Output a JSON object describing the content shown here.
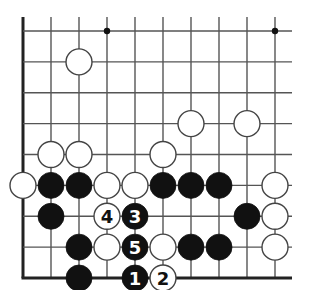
{
  "diagram": {
    "type": "go-board-fragment",
    "columns": 10,
    "rows": 9,
    "edges": {
      "left": true,
      "bottom": true,
      "top": false,
      "right": false
    },
    "grid": {
      "x0": 23,
      "dx": 28.0,
      "y0": 31,
      "dy": 30.9,
      "top_extend": 14,
      "right_extend": 17
    },
    "colors": {
      "line": "#555555",
      "edge": "#222222",
      "black": "#111111",
      "white": "#ffffff",
      "stone_outline": "#444444"
    },
    "star_points": [
      {
        "col": 4,
        "row": 1
      },
      {
        "col": 10,
        "row": 1
      }
    ],
    "stones": [
      {
        "color": "white",
        "col": 3,
        "row": 2
      },
      {
        "color": "white",
        "col": 7,
        "row": 4
      },
      {
        "color": "white",
        "col": 9,
        "row": 4
      },
      {
        "color": "white",
        "col": 2,
        "row": 5
      },
      {
        "color": "white",
        "col": 3,
        "row": 5
      },
      {
        "color": "white",
        "col": 6,
        "row": 5
      },
      {
        "color": "white",
        "col": 1,
        "row": 6
      },
      {
        "color": "black",
        "col": 2,
        "row": 6
      },
      {
        "color": "black",
        "col": 3,
        "row": 6
      },
      {
        "color": "white",
        "col": 4,
        "row": 6
      },
      {
        "color": "white",
        "col": 5,
        "row": 6
      },
      {
        "color": "black",
        "col": 6,
        "row": 6
      },
      {
        "color": "black",
        "col": 7,
        "row": 6
      },
      {
        "color": "black",
        "col": 8,
        "row": 6
      },
      {
        "color": "white",
        "col": 10,
        "row": 6
      },
      {
        "color": "black",
        "col": 2,
        "row": 7
      },
      {
        "color": "white",
        "col": 4,
        "row": 7,
        "label": "4"
      },
      {
        "color": "black",
        "col": 5,
        "row": 7,
        "label": "3"
      },
      {
        "color": "black",
        "col": 9,
        "row": 7
      },
      {
        "color": "white",
        "col": 10,
        "row": 7
      },
      {
        "color": "black",
        "col": 3,
        "row": 8
      },
      {
        "color": "white",
        "col": 4,
        "row": 8
      },
      {
        "color": "black",
        "col": 5,
        "row": 8,
        "label": "5"
      },
      {
        "color": "white",
        "col": 6,
        "row": 8
      },
      {
        "color": "black",
        "col": 7,
        "row": 8
      },
      {
        "color": "black",
        "col": 8,
        "row": 8
      },
      {
        "color": "white",
        "col": 10,
        "row": 8
      },
      {
        "color": "black",
        "col": 3,
        "row": 9
      },
      {
        "color": "black",
        "col": 5,
        "row": 9,
        "label": "1"
      },
      {
        "color": "white",
        "col": 6,
        "row": 9,
        "label": "2"
      }
    ]
  }
}
